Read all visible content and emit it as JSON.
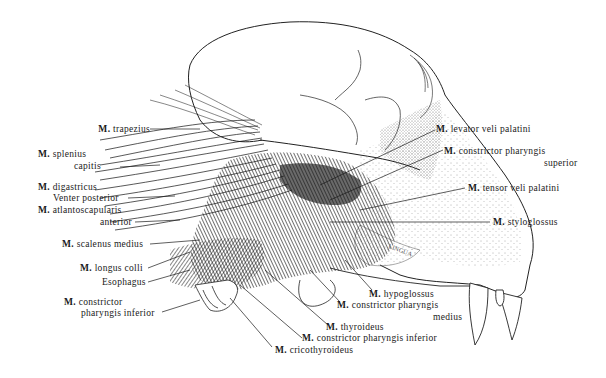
{
  "figure": {
    "tongue_label": "LINGUA",
    "colors": {
      "ink": "#1a1a1a",
      "background": "#ffffff"
    }
  },
  "labels": {
    "left": [
      {
        "id": "trapezius",
        "prefix": "M.",
        "lines": [
          "trapezius"
        ]
      },
      {
        "id": "splenius",
        "prefix": "M.",
        "lines": [
          "splenius",
          "capitis"
        ]
      },
      {
        "id": "digastricus",
        "prefix": "M.",
        "lines": [
          "digastricus",
          "Venter posterior"
        ]
      },
      {
        "id": "atlantoscapularis",
        "prefix": "M.",
        "lines": [
          "atlantoscapularis",
          "anterior"
        ]
      },
      {
        "id": "scalenus",
        "prefix": "M.",
        "lines": [
          "scalenus medius"
        ]
      },
      {
        "id": "longus",
        "prefix": "M.",
        "lines": [
          "longus colli"
        ]
      },
      {
        "id": "esophagus",
        "prefix": "",
        "lines": [
          "Esophagus"
        ]
      },
      {
        "id": "constrictor_inf_left",
        "prefix": "M.",
        "lines": [
          "constrictor",
          "pharyngis inferior"
        ]
      }
    ],
    "right": [
      {
        "id": "levator",
        "prefix": "M.",
        "lines": [
          "levator veli palatini"
        ]
      },
      {
        "id": "constrictor_sup",
        "prefix": "M.",
        "lines": [
          "constrictor pharyngis",
          "superior"
        ]
      },
      {
        "id": "tensor",
        "prefix": "M.",
        "lines": [
          "tensor veli palatini"
        ]
      },
      {
        "id": "styloglossus",
        "prefix": "M.",
        "lines": [
          "styloglossus"
        ]
      }
    ],
    "bottom": [
      {
        "id": "hypoglossus",
        "prefix": "M.",
        "lines": [
          "hypoglossus"
        ]
      },
      {
        "id": "constrictor_med",
        "prefix": "M.",
        "lines": [
          "constrictor pharyngis",
          "medius"
        ]
      },
      {
        "id": "thyroideus",
        "prefix": "M.",
        "lines": [
          "thyroideus"
        ]
      },
      {
        "id": "constrictor_inf_bottom",
        "prefix": "M.",
        "lines": [
          "constrictor pharyngis inferior"
        ]
      },
      {
        "id": "cricothyroideus",
        "prefix": "M.",
        "lines": [
          "cricothyroideus"
        ]
      }
    ]
  }
}
